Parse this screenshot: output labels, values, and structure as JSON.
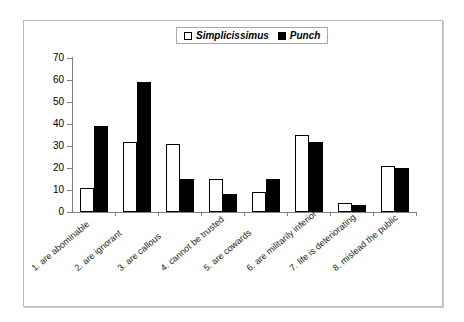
{
  "chart_data": {
    "type": "bar",
    "title": "",
    "xlabel": "",
    "ylabel": "",
    "ylim": [
      0,
      70
    ],
    "yticks": [
      0,
      10,
      20,
      30,
      40,
      50,
      60,
      70
    ],
    "grid": false,
    "legend_position": "top-center",
    "categories": [
      "1. are abominable",
      "2. are ignorant",
      "3. are callous",
      "4. cannot be trusted",
      "5. are cowards",
      "6. are militarily inferior",
      "7. life is deteriorating",
      "8. mislead the public"
    ],
    "series": [
      {
        "name": "Simplicissimus",
        "fill": "#ffffff",
        "stroke": "#000000",
        "values": [
          11,
          32,
          31,
          15,
          9,
          35,
          4,
          21
        ]
      },
      {
        "name": "Punch",
        "fill": "#000000",
        "stroke": "#000000",
        "values": [
          39,
          59,
          15,
          8,
          15,
          32,
          3,
          20
        ]
      }
    ]
  },
  "legend": {
    "entries": [
      {
        "label": "Simplicissimus",
        "swatch": "white-square"
      },
      {
        "label": "Punch",
        "swatch": "black-square"
      }
    ]
  },
  "colors": {
    "frame": "#b9b9b9",
    "axis": "#808080",
    "text": "#000000",
    "bar_outline": "#000000"
  }
}
